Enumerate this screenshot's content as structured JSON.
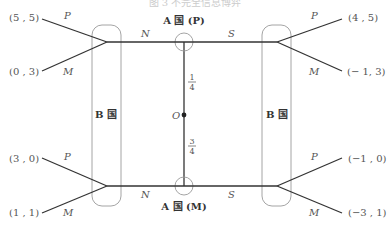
{
  "caption": "图 3  不完全信息博弈",
  "players": {
    "a_top": "A 国 (P)",
    "a_bottom": "A 国 (M)",
    "b_left": "B 国",
    "b_right": "B 国"
  },
  "nature": {
    "label": "O",
    "prob_top": {
      "num": "1",
      "den": "4"
    },
    "prob_bottom": {
      "num": "3",
      "den": "4"
    }
  },
  "moves": {
    "a_left": "N",
    "a_right": "S",
    "b_up": "P",
    "b_down": "M"
  },
  "payoffs": {
    "top_left_p": "(5 , 5)",
    "top_left_m": "(0 , 3)",
    "top_right_p": "(4 , 5)",
    "top_right_m": "(− 1, 3)",
    "bottom_left_p": "(3 , 0)",
    "bottom_left_m": "(1 , 1)",
    "bottom_right_p": "(−1 , 0)",
    "bottom_right_m": "(−3 , 1)"
  },
  "colors": {
    "edge": "#333333",
    "info_set": "#9a9a9a",
    "text": "#555555"
  }
}
